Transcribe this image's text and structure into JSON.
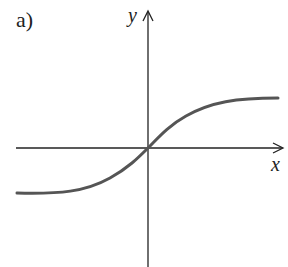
{
  "figure": {
    "panel_label": "a)",
    "x_axis_label": "x",
    "y_axis_label": "y",
    "curve_description": "sigmoid-shaped curve passing through the origin, approaching a lower horizontal asymptote on the left and an upper horizontal asymptote on the right",
    "colors": {
      "axes": "#222222",
      "curve": "#555555",
      "background": "#ffffff"
    }
  }
}
